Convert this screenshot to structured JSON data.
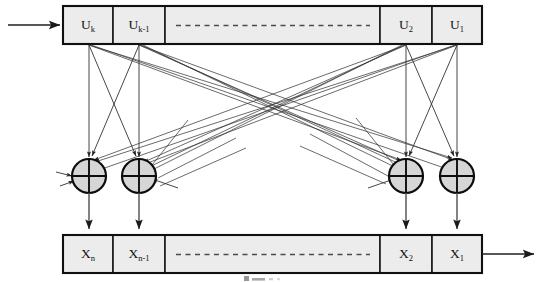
{
  "figure": {
    "background_color": "#ffffff",
    "line_color": "#262626",
    "cell_fill_color": "#ececec",
    "node_fill_color": "#d6d6d6"
  },
  "input": {
    "label": "",
    "arrow_name": "input-arrow"
  },
  "output": {
    "label": "",
    "arrow_name": "output-arrow"
  },
  "top_register": {
    "name": "u-register",
    "cells": [
      {
        "base": "U",
        "sub": "k",
        "kind": "cell"
      },
      {
        "base": "U",
        "sub": "k-1",
        "kind": "cell"
      },
      {
        "base": "",
        "sub": "",
        "kind": "ellipsis"
      },
      {
        "base": "U",
        "sub": "2",
        "kind": "cell"
      },
      {
        "base": "U",
        "sub": "1",
        "kind": "cell"
      }
    ]
  },
  "bottom_register": {
    "name": "x-register",
    "cells": [
      {
        "base": "X",
        "sub": "n",
        "kind": "cell"
      },
      {
        "base": "X",
        "sub": "n-1",
        "kind": "cell"
      },
      {
        "base": "",
        "sub": "",
        "kind": "ellipsis"
      },
      {
        "base": "X",
        "sub": "2",
        "kind": "cell"
      },
      {
        "base": "X",
        "sub": "1",
        "kind": "cell"
      }
    ]
  },
  "adders": {
    "symbol": "xor-plus",
    "count": 4,
    "nodes": [
      {
        "name": "xor-node-1"
      },
      {
        "name": "xor-node-2"
      },
      {
        "name": "xor-node-3"
      },
      {
        "name": "xor-node-4"
      }
    ]
  },
  "caption": {
    "text": ""
  }
}
